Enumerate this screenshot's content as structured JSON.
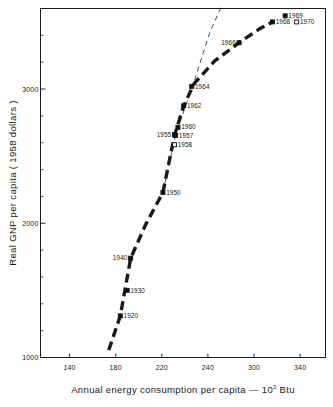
{
  "chart_data": {
    "type": "scatter",
    "title": "",
    "xlabel": "Annual energy consumption per capita — 10³ Btu",
    "xlabel_main": "Annual energy consumption per capita  —  10",
    "xlabel_sup": "3",
    "xlabel_tail": "Btu",
    "ylabel": "Real GNP per capita ( 1958 dollars )",
    "xlim": [
      140,
      360
    ],
    "ylim": [
      1000,
      3600
    ],
    "xticks": [
      140,
      180,
      220,
      240,
      300,
      340
    ],
    "xtick_labels": [
      "140",
      "180",
      "220",
      "240",
      "300",
      "340"
    ],
    "yticks": [
      1000,
      2000,
      3000
    ],
    "ytick_labels": [
      "1000",
      "2000",
      "3000"
    ],
    "grid": false,
    "legend": false,
    "series": [
      {
        "name": "Real GNP per capita vs annual energy consumption per capita",
        "marker": "filled-square",
        "points": [
          {
            "label": "1920",
            "x": 184,
            "y": 1310,
            "filled": true,
            "label_side": "right"
          },
          {
            "label": "1930",
            "x": 190,
            "y": 1500,
            "filled": true,
            "label_side": "right"
          },
          {
            "label": "1940",
            "x": 193,
            "y": 1740,
            "filled": true,
            "label_side": "left"
          },
          {
            "label": "1950",
            "x": 221,
            "y": 2230,
            "filled": true,
            "label_side": "right"
          },
          {
            "label": "1955",
            "x": 231,
            "y": 2660,
            "filled": true,
            "label_side": "left"
          },
          {
            "label": "1957",
            "x": 232,
            "y": 2655,
            "filled": true,
            "label_side": "right"
          },
          {
            "label": "1958",
            "x": 231,
            "y": 2585,
            "filled": false,
            "label_side": "right"
          },
          {
            "label": "1960",
            "x": 234,
            "y": 2715,
            "filled": true,
            "label_side": "right"
          },
          {
            "label": "1962",
            "x": 239,
            "y": 2875,
            "filled": true,
            "label_side": "right"
          },
          {
            "label": "1964",
            "x": 246,
            "y": 3020,
            "filled": true,
            "label_side": "right"
          },
          {
            "label": "1966",
            "x": 287,
            "y": 3345,
            "filled": true,
            "label_side": "left"
          },
          {
            "label": "1968",
            "x": 316,
            "y": 3500,
            "filled": true,
            "label_side": "right"
          },
          {
            "label": "1969",
            "x": 327,
            "y": 3545,
            "filled": true,
            "label_side": "right"
          },
          {
            "label": "1970",
            "x": 337,
            "y": 3500,
            "filled": false,
            "label_side": "right"
          }
        ]
      }
    ],
    "lines": [
      {
        "name": "trend-curve",
        "style": "thick-dashed",
        "points": [
          [
            174,
            1055
          ],
          [
            184,
            1310
          ],
          [
            193,
            1740
          ],
          [
            206,
            1990
          ],
          [
            221,
            2230
          ],
          [
            231,
            2655
          ],
          [
            239,
            2875
          ],
          [
            248,
            3040
          ],
          [
            266,
            3210
          ],
          [
            287,
            3345
          ],
          [
            305,
            3450
          ],
          [
            316,
            3500
          ]
        ]
      },
      {
        "name": "linear-extrapolation",
        "style": "thin-dashed",
        "points": [
          [
            221,
            2230
          ],
          [
            232,
            2660
          ],
          [
            248,
            3055
          ],
          [
            262,
            3430
          ],
          [
            272,
            3620
          ]
        ]
      }
    ]
  }
}
